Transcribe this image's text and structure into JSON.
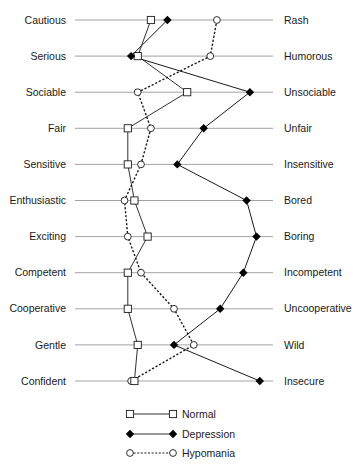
{
  "chart_data": {
    "type": "line",
    "title": "",
    "orientation": "horizontal-semantic-differential",
    "scale": [
      1,
      7
    ],
    "left_labels": [
      "Cautious",
      "Serious",
      "Sociable",
      "Fair",
      "Sensitive",
      "Enthusiastic",
      "Exciting",
      "Competent",
      "Cooperative",
      "Gentle",
      "Confident"
    ],
    "right_labels": [
      "Rash",
      "Humorous",
      "Unsociable",
      "Unfair",
      "Insensitive",
      "Bored",
      "Boring",
      "Incompetent",
      "Uncooperative",
      "Wild",
      "Insecure"
    ],
    "series": [
      {
        "name": "Normal",
        "marker": "open-square",
        "line": "solid",
        "color": "#1a1a1a",
        "values": [
          3.3,
          2.9,
          4.4,
          2.6,
          2.6,
          2.8,
          3.2,
          2.6,
          2.6,
          2.9,
          2.8
        ]
      },
      {
        "name": "Depression",
        "marker": "filled-diamond",
        "line": "solid",
        "color": "#000000",
        "values": [
          3.8,
          2.7,
          6.3,
          4.9,
          4.1,
          6.2,
          6.5,
          6.1,
          5.4,
          4.0,
          6.6
        ]
      },
      {
        "name": "Hypomania",
        "marker": "open-circle",
        "line": "dotted",
        "color": "#1a1a1a",
        "values": [
          5.3,
          5.1,
          2.9,
          3.3,
          3.0,
          2.5,
          2.6,
          3.0,
          4.0,
          4.6,
          2.7
        ]
      }
    ],
    "legend": {
      "placement": "bottom-center",
      "entries": [
        "Normal",
        "Depression",
        "Hypomania"
      ]
    },
    "grid": false
  }
}
